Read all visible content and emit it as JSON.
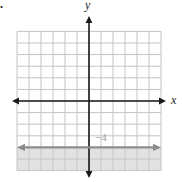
{
  "page": {
    "problem_number": "6."
  },
  "chart_data": {
    "type": "line",
    "title": "",
    "xlabel": "x",
    "ylabel": "y",
    "xlim": [
      -6,
      6
    ],
    "ylim": [
      -6,
      6
    ],
    "grid": true,
    "series": [
      {
        "name": "horizontal-boundary-line",
        "points": [
          [
            -6,
            -4
          ],
          [
            6,
            -4
          ]
        ],
        "color": "#8c8c8c",
        "arrows": "both",
        "label": "−4",
        "label_position": [
          0.6,
          -3.4
        ]
      }
    ],
    "shaded_region": {
      "description": "y <= -4",
      "from_y": -6,
      "to_y": -4,
      "color": "#c9c9c9"
    },
    "axis_color": "#1a1a1a",
    "grid_color": "#c4c4c4",
    "legend": "none"
  }
}
